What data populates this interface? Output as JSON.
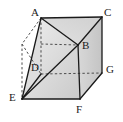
{
  "figure": {
    "kind": "solid-geometry-diagram",
    "shape_name": "cube",
    "width": 123,
    "height": 122,
    "background_color": "#ffffff",
    "edge_color": "#1a1a1a",
    "hidden_edge_color": "#4d4d4d",
    "face_fill_light": "#e8e8e8",
    "face_fill_mid": "#dcdcdc",
    "face_fill_dark": "#cfcfcf",
    "face_fill_darkest": "#c2c2c2"
  },
  "labels": {
    "a": "A",
    "b": "B",
    "c": "C",
    "d": "D",
    "e": "E",
    "f": "F",
    "g": "G"
  },
  "label_positions": {
    "a": {
      "x": 31,
      "y": 7
    },
    "b": {
      "x": 82,
      "y": 40
    },
    "c": {
      "x": 104,
      "y": 7
    },
    "d": {
      "x": 31,
      "y": 62
    },
    "e": {
      "x": 9,
      "y": 92
    },
    "f": {
      "x": 76,
      "y": 104
    },
    "g": {
      "x": 106,
      "y": 64
    }
  },
  "vertices": {
    "A": {
      "x": 41,
      "y": 18
    },
    "C": {
      "x": 102,
      "y": 17
    },
    "B": {
      "x": 78,
      "y": 45
    },
    "D": {
      "x": 41,
      "y": 74
    },
    "E": {
      "x": 22,
      "y": 99
    },
    "F": {
      "x": 80,
      "y": 99
    },
    "G": {
      "x": 102,
      "y": 73
    },
    "H": {
      "x": 22,
      "y": 44
    }
  },
  "edges": {
    "solid": [
      {
        "name": "edge-A-C",
        "from": "A",
        "to": "C"
      },
      {
        "name": "edge-C-G",
        "from": "C",
        "to": "G"
      },
      {
        "name": "edge-G-F",
        "from": "G",
        "to": "F"
      },
      {
        "name": "edge-F-E",
        "from": "F",
        "to": "E"
      },
      {
        "name": "edge-E-A",
        "from": "E",
        "to": "A"
      },
      {
        "name": "edge-B-F",
        "from": "B",
        "to": "F"
      },
      {
        "name": "edge-A-B",
        "from": "A",
        "to": "B"
      },
      {
        "name": "edge-C-B",
        "from": "C",
        "to": "B"
      },
      {
        "name": "edge-E-B",
        "from": "E",
        "to": "B"
      },
      {
        "name": "edge-E-D",
        "from": "E",
        "to": "D"
      }
    ],
    "dashed": [
      {
        "name": "hidden-edge-A-H",
        "from": "A",
        "to": "H"
      },
      {
        "name": "hidden-edge-H-E",
        "from": "H",
        "to": "E"
      },
      {
        "name": "hidden-edge-H-D",
        "from": "H",
        "to": "D"
      },
      {
        "name": "hidden-edge-A-D",
        "from": "A",
        "to": "D"
      },
      {
        "name": "hidden-edge-D-B",
        "from": "D",
        "to": "B"
      },
      {
        "name": "hidden-edge-D-G",
        "from": "D",
        "to": "G"
      }
    ]
  }
}
